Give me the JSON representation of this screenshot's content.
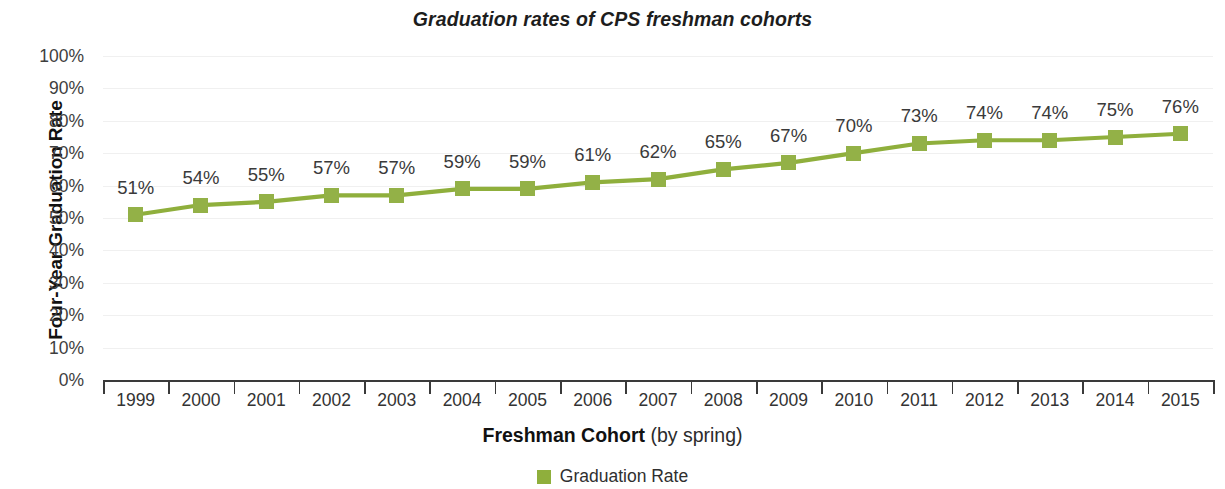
{
  "chart_data": {
    "type": "line",
    "title": "Graduation rates of CPS freshman cohorts",
    "xlabel_strong": "Freshman Cohort",
    "xlabel_light": " (by spring)",
    "ylabel": "Four-Year Graduation Rate",
    "categories": [
      "1999",
      "2000",
      "2001",
      "2002",
      "2003",
      "2004",
      "2005",
      "2006",
      "2007",
      "2008",
      "2009",
      "2010",
      "2011",
      "2012",
      "2013",
      "2014",
      "2015"
    ],
    "values": [
      51,
      54,
      55,
      57,
      57,
      59,
      59,
      61,
      62,
      65,
      67,
      70,
      73,
      74,
      74,
      75,
      76
    ],
    "data_labels": [
      "51%",
      "54%",
      "55%",
      "57%",
      "57%",
      "59%",
      "59%",
      "61%",
      "62%",
      "65%",
      "67%",
      "70%",
      "73%",
      "74%",
      "74%",
      "75%",
      "76%"
    ],
    "ytick_labels": [
      "0%",
      "10%",
      "20%",
      "30%",
      "40%",
      "50%",
      "60%",
      "70%",
      "80%",
      "90%",
      "100%"
    ],
    "ytick_values": [
      0,
      10,
      20,
      30,
      40,
      50,
      60,
      70,
      80,
      90,
      100
    ],
    "ylim": [
      0,
      100
    ],
    "grid": true,
    "legend": {
      "position": "bottom",
      "entries": [
        {
          "name": "Graduation Rate",
          "color": "#8FAF3C",
          "marker": "square"
        }
      ]
    },
    "series": [
      {
        "name": "Graduation Rate",
        "color": "#8FAF3C",
        "values": [
          51,
          54,
          55,
          57,
          57,
          59,
          59,
          61,
          62,
          65,
          67,
          70,
          73,
          74,
          74,
          75,
          76
        ]
      }
    ],
    "colors": {
      "line": "#8FAF3C",
      "marker": "#93B147",
      "axis": "#3a3a3a",
      "grid": "#f0f0f0",
      "text": "#333333",
      "title": "#1d1d1d",
      "background": "#ffffff"
    }
  }
}
